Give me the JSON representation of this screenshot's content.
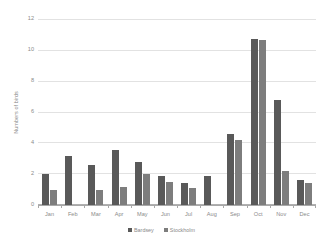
{
  "chart_data": {
    "type": "bar",
    "title": "",
    "subtitle": "",
    "xlabel": "",
    "ylabel": "Numbers of birds",
    "categories": [
      "Jan",
      "Feb",
      "Mar",
      "Apr",
      "May",
      "Jun",
      "Jul",
      "Aug",
      "Sep",
      "Oct",
      "Nov",
      "Dec"
    ],
    "series": [
      {
        "name": "Bardsey",
        "color": "#595959",
        "values": [
          2.0,
          3.2,
          2.6,
          3.6,
          2.8,
          1.9,
          1.4,
          1.9,
          4.6,
          10.8,
          6.8,
          1.6
        ]
      },
      {
        "name": "Stockholm",
        "color": "#7d7d7d",
        "values": [
          1.0,
          0.0,
          1.0,
          1.2,
          2.0,
          1.5,
          1.1,
          0.0,
          4.2,
          10.7,
          2.2,
          1.4
        ]
      }
    ],
    "ylim": [
      0,
      12
    ],
    "yticks": [
      0,
      2,
      4,
      6,
      8,
      10,
      12
    ],
    "ytick_labels": [
      "0",
      "2",
      "4",
      "6",
      "8",
      "10",
      "12"
    ],
    "grid": true,
    "grid_axis": "y",
    "legend_position": "bottom",
    "legend_entries": [
      "Bardsey",
      "Stockholm"
    ],
    "annotations": []
  }
}
